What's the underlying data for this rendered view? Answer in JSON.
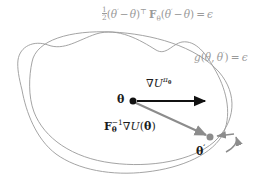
{
  "figure": {
    "background_color": "#ffffff",
    "contour_color": "#9a9a9a",
    "black_arrow_color": "#111111",
    "gray_arrow_color": "#8c8c8c",
    "gray_text_color": "#9a9a9a",
    "dark_text_color": "#1c1c1c"
  },
  "equations": {
    "quadratic": {
      "id": "fisher-quadratic-constraint",
      "plain": "1/2 (theta' - theta)^T F_theta (theta' - theta) = epsilon",
      "fraction_numerator": "1",
      "fraction_denominator": "2",
      "open_paren": "(",
      "theta_prime": "θ",
      "prime": "′",
      "minus": "−",
      "theta": "θ",
      "close_paren": ")",
      "transpose": "⊤",
      "fisher_symbol": "F",
      "fisher_subscript": "θ",
      "equals": "=",
      "epsilon": "ϵ"
    },
    "constraint": {
      "id": "kl-constraint",
      "plain": "g(theta, theta') = epsilon",
      "g": "g",
      "open_paren": "(",
      "theta": "θ",
      "comma": ",",
      "theta_prime": "θ",
      "prime": "′",
      "close_paren": ")",
      "equals": "=",
      "epsilon": "ϵ"
    }
  },
  "labels": {
    "gradient": {
      "id": "vanilla-gradient-label",
      "plain": "grad U^{pi_theta}",
      "nabla": "∇",
      "u": "U",
      "pi": "π",
      "theta": "θ"
    },
    "natural_gradient": {
      "id": "natural-gradient-label",
      "plain": "F_theta^{-1} grad U(theta)",
      "fisher_symbol": "F",
      "subscript": "θ",
      "superscript": "−1",
      "nabla": "∇",
      "u": "U",
      "open_paren": "(",
      "theta": "θ",
      "close_paren": ")"
    },
    "theta_point": {
      "id": "theta-point-label",
      "text": "θ"
    },
    "theta_prime_point": {
      "id": "theta-prime-point-label",
      "theta": "θ",
      "prime": "′"
    }
  },
  "geometry": {
    "theta_point": {
      "x": 133,
      "y": 101,
      "radius": 3.6,
      "color": "#111111"
    },
    "theta_prime_point": {
      "x": 210,
      "y": 137,
      "radius": 3.6,
      "color": "#8c8c8c"
    },
    "gradient_arrow": {
      "x1": 136,
      "y1": 101,
      "x2": 208,
      "y2": 101,
      "color": "#111111",
      "width": 2.2
    },
    "natural_gradient_arrow": {
      "x1": 136,
      "y1": 103,
      "x2": 208,
      "y2": 136,
      "color": "#8c8c8c",
      "width": 2.2
    },
    "correction_arrow": {
      "x1": 236,
      "y1": 134,
      "x2": 216,
      "y2": 136,
      "color": "#8c8c8c",
      "width": 1.6
    },
    "curved_arrow": {
      "x1": 238,
      "y1": 136,
      "x2": 214,
      "y2": 147,
      "color": "#8c8c8c",
      "width": 1.6
    },
    "contours": [
      {
        "name": "fisher-ellipse",
        "stroke": "#9a9a9a",
        "stroke_width": 0.9
      },
      {
        "name": "kl-blob",
        "stroke": "#9a9a9a",
        "stroke_width": 0.9
      }
    ]
  }
}
